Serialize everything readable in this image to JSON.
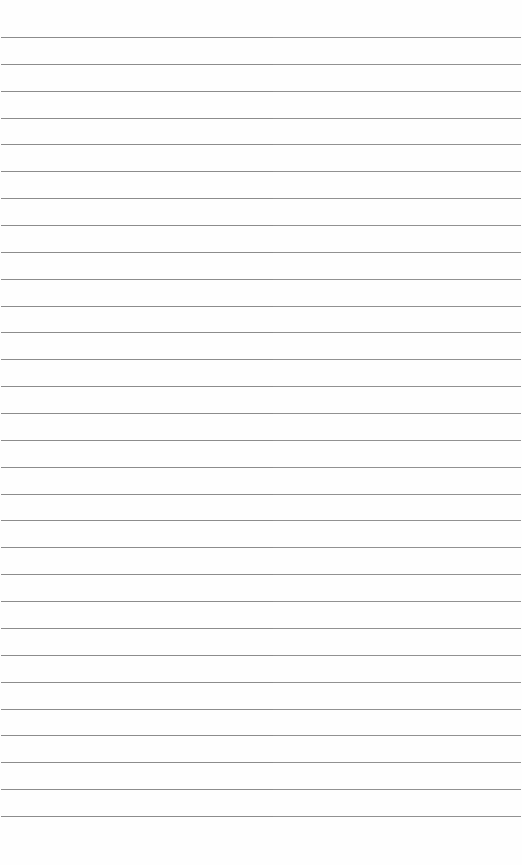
{
  "page": {
    "type": "ruled-paper",
    "line_count": 30,
    "first_line_y": 37,
    "line_spacing": 26.86,
    "line_color": "#8a8a8a",
    "background_color": "#fefefe",
    "text": ""
  }
}
